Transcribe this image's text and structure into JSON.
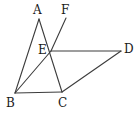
{
  "figure": {
    "type": "geometry-diagram",
    "title": "",
    "background_color": "#ffffff",
    "stroke_color": "#3c3c3c",
    "label_color": "#1a1a1a",
    "stroke_width": 1.1,
    "canvas": {
      "width": 140,
      "height": 117
    },
    "points": [
      {
        "id": "A",
        "label": "A",
        "x": 39,
        "y": 19,
        "label_x": 33,
        "label_y": 4
      },
      {
        "id": "B",
        "label": "B",
        "x": 15,
        "y": 93,
        "label_x": 6,
        "label_y": 97
      },
      {
        "id": "C",
        "label": "C",
        "x": 62,
        "y": 92,
        "label_x": 58,
        "label_y": 97
      },
      {
        "id": "D",
        "label": "D",
        "x": 121,
        "y": 51,
        "label_x": 124,
        "label_y": 43
      },
      {
        "id": "E",
        "label": "E",
        "x": 51,
        "y": 51,
        "label_x": 38,
        "label_y": 44
      },
      {
        "id": "F",
        "label": "F",
        "x": 66,
        "y": 18,
        "label_x": 61,
        "label_y": 4
      }
    ],
    "segments": [
      {
        "id": "AB",
        "name": "segment-ab",
        "from": "A",
        "to": "B"
      },
      {
        "id": "AC",
        "name": "segment-ac",
        "from": "A",
        "to": "C"
      },
      {
        "id": "BC",
        "name": "segment-bc",
        "from": "B",
        "to": "C"
      },
      {
        "id": "BE",
        "name": "segment-be",
        "from": "B",
        "to": "E"
      },
      {
        "id": "EF",
        "name": "segment-ef",
        "from": "E",
        "to": "F"
      },
      {
        "id": "ED",
        "name": "segment-ed",
        "from": "E",
        "to": "D"
      },
      {
        "id": "CD",
        "name": "segment-cd",
        "from": "C",
        "to": "D"
      }
    ]
  }
}
